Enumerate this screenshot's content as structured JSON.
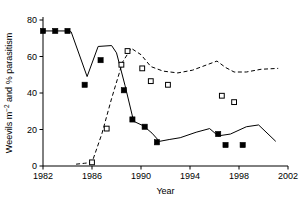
{
  "chart_data": {
    "type": "line",
    "title": "",
    "xlabel": "Year",
    "ylabel": "Weevils m-2 and % parasitism",
    "ylabel_main": "Weevils m",
    "ylabel_sup": "−2",
    "ylabel_rest": " and % parasitism",
    "xlim": [
      1982,
      2002
    ],
    "ylim": [
      0,
      80
    ],
    "xticks": [
      1982,
      1986,
      1990,
      1994,
      1998,
      2002
    ],
    "xtick_labels": [
      "1982",
      "1986",
      "1990",
      "1994",
      "1998",
      "2002"
    ],
    "yticks": [
      0,
      20,
      40,
      60,
      80
    ],
    "ytick_labels": [
      "0",
      "20",
      "40",
      "60",
      "80"
    ],
    "grid": false,
    "legend": "none",
    "series": [
      {
        "name": "Weevils m-2",
        "marker": "filled-square",
        "linestyle": "solid",
        "color": "#000000",
        "line": [
          {
            "x": 1982.0,
            "y": 74.0
          },
          {
            "x": 1983.0,
            "y": 74.0
          },
          {
            "x": 1984.0,
            "y": 74.0
          },
          {
            "x": 1984.3,
            "y": 73.5
          },
          {
            "x": 1985.6,
            "y": 49.0
          },
          {
            "x": 1986.5,
            "y": 65.5
          },
          {
            "x": 1987.6,
            "y": 66.0
          },
          {
            "x": 1988.0,
            "y": 62.0
          },
          {
            "x": 1988.7,
            "y": 44.0
          },
          {
            "x": 1989.4,
            "y": 24.5
          },
          {
            "x": 1990.2,
            "y": 22.0
          },
          {
            "x": 1990.9,
            "y": 18.0
          },
          {
            "x": 1991.5,
            "y": 13.5
          },
          {
            "x": 1992.3,
            "y": 14.5
          },
          {
            "x": 1993.2,
            "y": 15.5
          },
          {
            "x": 1994.5,
            "y": 18.5
          },
          {
            "x": 1995.6,
            "y": 20.5
          },
          {
            "x": 1996.3,
            "y": 16.5
          },
          {
            "x": 1997.3,
            "y": 17.5
          },
          {
            "x": 1998.6,
            "y": 21.5
          },
          {
            "x": 1999.6,
            "y": 22.5
          },
          {
            "x": 2001.0,
            "y": 13.5
          }
        ],
        "points": [
          {
            "x": 1982.0,
            "y": 74.0
          },
          {
            "x": 1983.0,
            "y": 74.0
          },
          {
            "x": 1984.0,
            "y": 74.0
          },
          {
            "x": 1985.4,
            "y": 44.5
          },
          {
            "x": 1986.7,
            "y": 58.0
          },
          {
            "x": 1988.6,
            "y": 41.5
          },
          {
            "x": 1989.3,
            "y": 25.5
          },
          {
            "x": 1990.3,
            "y": 21.5
          },
          {
            "x": 1991.3,
            "y": 13.0
          },
          {
            "x": 1996.3,
            "y": 17.5
          },
          {
            "x": 1996.9,
            "y": 11.5
          },
          {
            "x": 1998.3,
            "y": 11.5
          }
        ]
      },
      {
        "name": "% parasitism",
        "marker": "open-square",
        "linestyle": "dashed",
        "color": "#000000",
        "line": [
          {
            "x": 1984.7,
            "y": 1.0
          },
          {
            "x": 1985.4,
            "y": 1.5
          },
          {
            "x": 1986.0,
            "y": 2.0
          },
          {
            "x": 1986.8,
            "y": 17.5
          },
          {
            "x": 1987.6,
            "y": 37.0
          },
          {
            "x": 1988.5,
            "y": 57.0
          },
          {
            "x": 1989.2,
            "y": 64.5
          },
          {
            "x": 1990.0,
            "y": 61.0
          },
          {
            "x": 1990.8,
            "y": 54.5
          },
          {
            "x": 1991.8,
            "y": 52.0
          },
          {
            "x": 1993.0,
            "y": 51.0
          },
          {
            "x": 1994.2,
            "y": 52.5
          },
          {
            "x": 1995.4,
            "y": 55.5
          },
          {
            "x": 1996.2,
            "y": 57.5
          },
          {
            "x": 1996.9,
            "y": 54.0
          },
          {
            "x": 1997.6,
            "y": 51.5
          },
          {
            "x": 1998.6,
            "y": 51.5
          },
          {
            "x": 1999.8,
            "y": 53.0
          },
          {
            "x": 2001.2,
            "y": 53.5
          }
        ],
        "points": [
          {
            "x": 1986.0,
            "y": 2.0
          },
          {
            "x": 1987.2,
            "y": 20.5
          },
          {
            "x": 1988.4,
            "y": 55.5
          },
          {
            "x": 1988.9,
            "y": 63.0
          },
          {
            "x": 1990.1,
            "y": 53.5
          },
          {
            "x": 1990.8,
            "y": 46.5
          },
          {
            "x": 1992.2,
            "y": 44.5
          },
          {
            "x": 1996.6,
            "y": 38.5
          },
          {
            "x": 1997.6,
            "y": 35.0
          }
        ]
      }
    ]
  }
}
